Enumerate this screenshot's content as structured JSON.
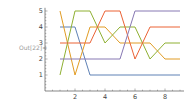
{
  "cell": {
    "out_label": "Out[22]="
  },
  "chart_data": {
    "type": "line",
    "title": "",
    "xlabel": "",
    "ylabel": "",
    "x": [
      1,
      2,
      3,
      4,
      5,
      6,
      7,
      8,
      9
    ],
    "series": [
      {
        "name": "series-1",
        "color": "#5E81B5",
        "values": [
          4,
          4,
          1,
          1,
          1,
          1,
          1,
          1,
          1
        ]
      },
      {
        "name": "series-2",
        "color": "#E19C24",
        "values": [
          5,
          1,
          4,
          4,
          3,
          3,
          3,
          2,
          2
        ]
      },
      {
        "name": "series-3",
        "color": "#8FB032",
        "values": [
          1,
          5,
          5,
          3,
          4,
          4,
          2,
          3,
          3
        ]
      },
      {
        "name": "series-4",
        "color": "#EB6235",
        "values": [
          3,
          3,
          3,
          5,
          5,
          2,
          4,
          4,
          4
        ]
      },
      {
        "name": "series-5",
        "color": "#8778B3",
        "values": [
          2,
          2,
          2,
          2,
          2,
          5,
          5,
          5,
          5
        ]
      }
    ],
    "xticks": [
      2,
      4,
      6,
      8
    ],
    "yticks": [
      1,
      2,
      3,
      4,
      5
    ],
    "xlim": [
      0,
      9.2
    ],
    "ylim": [
      0,
      5.2
    ],
    "grid": false,
    "legend": "none"
  }
}
